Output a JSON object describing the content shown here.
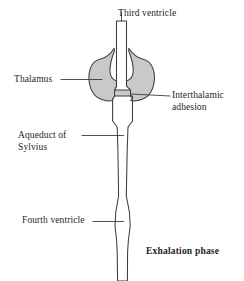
{
  "figure": {
    "phase_caption": "Exhalation phase",
    "colors": {
      "stroke": "#3c3c3c",
      "thalamus_fill": "#c9c9c9",
      "ventricle_fill": "#ffffff",
      "leader_line": "#3c3c3c",
      "text": "#231f1f",
      "background": "#ffffff"
    },
    "labels": {
      "third_ventricle": "Third ventricle",
      "thalamus": "Thalamus",
      "interthalamic_adhesion_line1": "Interthalamic",
      "interthalamic_adhesion_line2": "adhesion",
      "aqueduct_line1": "Aqueduct of",
      "aqueduct_line2": "Sylvius",
      "fourth_ventricle": "Fourth ventricle"
    },
    "structures": [
      {
        "name": "third-ventricle",
        "description": "Narrow vertical channel at top descending into thalamic cleft"
      },
      {
        "name": "thalamus-left-lobe",
        "description": "Gray ovoid mass left of midline"
      },
      {
        "name": "thalamus-right-lobe",
        "description": "Gray ovoid mass right of midline"
      },
      {
        "name": "interthalamic-adhesion",
        "description": "Midline bridge joining the two thalamic lobes"
      },
      {
        "name": "cerebral-aqueduct",
        "description": "Long narrow channel of Sylvius below the thalamus"
      },
      {
        "name": "fourth-ventricle",
        "description": "Fusiform dilation low in the channel"
      }
    ]
  }
}
